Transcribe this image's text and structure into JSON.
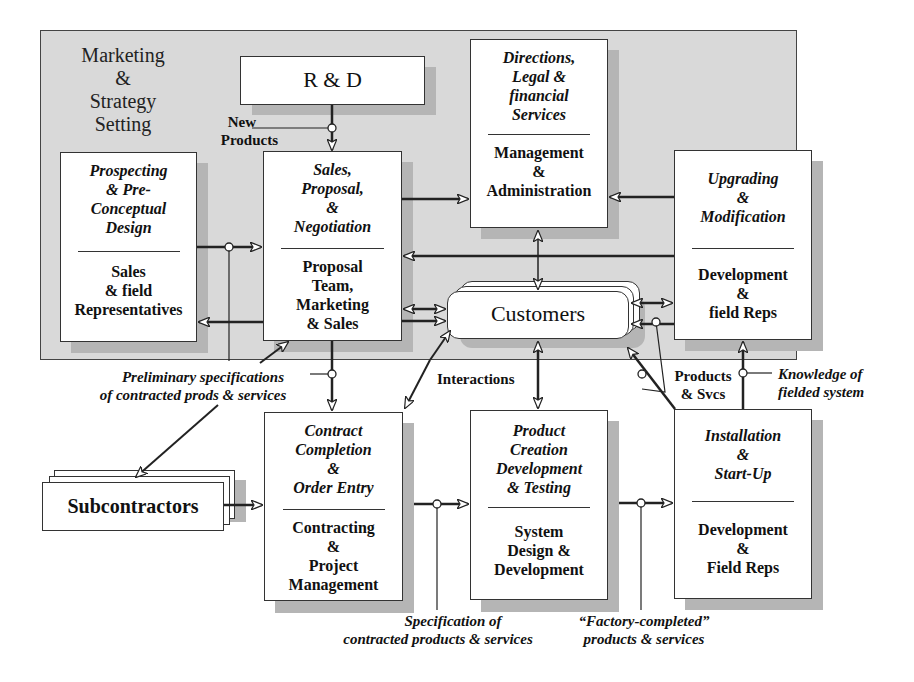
{
  "region": {
    "title": "Marketing & Strategy Setting",
    "title_lines": [
      "Marketing",
      "&",
      "Strategy",
      "Setting"
    ]
  },
  "nodes": {
    "rnd": {
      "label": "R & D"
    },
    "prospecting": {
      "activity": [
        "Prospecting",
        "& Pre-",
        "Conceptual",
        "Design"
      ],
      "actor": [
        "Sales",
        "& field",
        "Representatives"
      ]
    },
    "sales": {
      "activity": [
        "Sales,",
        "Proposal,",
        "&",
        "Negotiation"
      ],
      "actor": [
        "Proposal",
        "Team,",
        "Marketing",
        "& Sales"
      ]
    },
    "directions": {
      "activity": [
        "Directions,",
        "Legal &",
        "financial",
        "Services"
      ],
      "actor": [
        "Management",
        "&",
        "Administration"
      ]
    },
    "upgrading": {
      "activity": [
        "Upgrading",
        "&",
        "Modification"
      ],
      "actor": [
        "Development",
        "&",
        "field Reps"
      ]
    },
    "customers": {
      "label": "Customers"
    },
    "subcontractors": {
      "label": "Subcontractors"
    },
    "contract": {
      "activity": [
        "Contract",
        "Completion",
        "&",
        "Order Entry"
      ],
      "actor": [
        "Contracting",
        "&",
        "Project",
        "Management"
      ]
    },
    "product": {
      "activity": [
        "Product",
        "Creation",
        "Development",
        "& Testing"
      ],
      "actor": [
        "System",
        "Design &",
        "Development"
      ]
    },
    "installation": {
      "activity": [
        "Installation",
        "&",
        "Start-Up"
      ],
      "actor": [
        "Development",
        "&",
        "Field Reps"
      ]
    }
  },
  "labels": {
    "new_products": [
      "New",
      "Products"
    ],
    "preliminary_specs": [
      "Preliminary specifications",
      "of contracted prods & services"
    ],
    "interactions": "Interactions",
    "products_svcs": [
      "Products",
      "& Svcs"
    ],
    "knowledge": [
      "Knowledge of",
      "fielded system"
    ],
    "specification": [
      "Specification of",
      "contracted products & services"
    ],
    "factory_completed": [
      "“Factory-completed”",
      "products & services"
    ]
  },
  "colors": {
    "region_fill": "#d9d9d9",
    "shadow": "#b5b5b5",
    "box_fill": "#ffffff",
    "line": "#222222"
  }
}
